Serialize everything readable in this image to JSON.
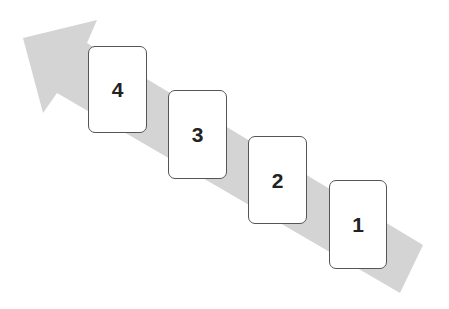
{
  "diagram": {
    "type": "step-sequence",
    "arrow": {
      "direction": "up-left",
      "color": "#d4d4d4",
      "points": "23,38 97,20 87,43 423,245 400,293 57,93 43,113"
    },
    "cards": [
      {
        "label": "4",
        "x": 88,
        "y": 46,
        "w": 59,
        "h": 87
      },
      {
        "label": "3",
        "x": 168,
        "y": 90,
        "w": 59,
        "h": 89
      },
      {
        "label": "2",
        "x": 248,
        "y": 136,
        "w": 59,
        "h": 88
      },
      {
        "label": "1",
        "x": 329,
        "y": 180,
        "w": 58,
        "h": 89
      }
    ]
  }
}
